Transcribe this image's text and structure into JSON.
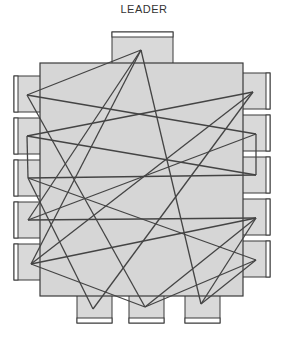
{
  "title": "LEADER",
  "colors": {
    "table_fill": "#d6d6d6",
    "chair_fill": "#d9d9d9",
    "outline": "#3a3a3a",
    "line": "#444444",
    "background": "#ffffff"
  },
  "seats": [
    {
      "id": "leader",
      "side": "top",
      "label": "LEADER"
    },
    {
      "id": "left-1",
      "side": "left"
    },
    {
      "id": "left-2",
      "side": "left"
    },
    {
      "id": "left-3",
      "side": "left"
    },
    {
      "id": "left-4",
      "side": "left"
    },
    {
      "id": "left-5",
      "side": "left"
    },
    {
      "id": "right-1",
      "side": "right"
    },
    {
      "id": "right-2",
      "side": "right"
    },
    {
      "id": "right-3",
      "side": "right"
    },
    {
      "id": "right-4",
      "side": "right"
    },
    {
      "id": "right-5",
      "side": "right"
    },
    {
      "id": "bottom-1",
      "side": "bottom"
    },
    {
      "id": "bottom-2",
      "side": "bottom"
    },
    {
      "id": "bottom-3",
      "side": "bottom"
    }
  ],
  "connections": [
    [
      "leader",
      "left-1"
    ],
    [
      "leader",
      "left-4"
    ],
    [
      "leader",
      "left-5"
    ],
    [
      "leader",
      "bottom-3"
    ],
    [
      "left-1",
      "right-2"
    ],
    [
      "left-1",
      "bottom-2"
    ],
    [
      "right-1",
      "left-2"
    ],
    [
      "right-1",
      "bottom-1"
    ],
    [
      "right-1",
      "left-5"
    ],
    [
      "left-2",
      "right-3"
    ],
    [
      "left-2",
      "left-3"
    ],
    [
      "left-3",
      "right-3"
    ],
    [
      "left-3",
      "bottom-1"
    ],
    [
      "right-2",
      "left-4"
    ],
    [
      "right-2",
      "right-3"
    ],
    [
      "left-4",
      "right-4"
    ],
    [
      "right-4",
      "left-5"
    ],
    [
      "right-4",
      "bottom-2"
    ],
    [
      "left-5",
      "bottom-2"
    ],
    [
      "right-5",
      "bottom-2"
    ],
    [
      "right-5",
      "bottom-3"
    ],
    [
      "right-5",
      "left-3"
    ],
    [
      "right-4",
      "bottom-3"
    ]
  ]
}
